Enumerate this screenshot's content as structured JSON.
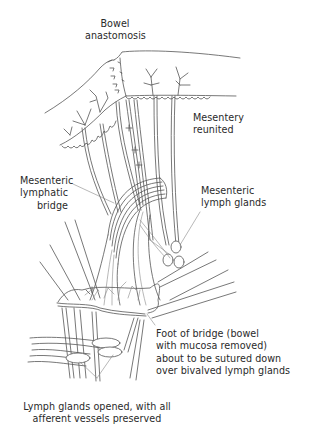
{
  "figure": {
    "type": "surgical-illustration",
    "stroke_color": "#555555",
    "label_color": "#2a2a2a",
    "background": "#ffffff"
  },
  "labels": {
    "bowel_anastomosis": {
      "lines": [
        "Bowel",
        "anastomosis"
      ]
    },
    "mesentery_reunited": {
      "lines": [
        "Mesentery",
        "reunited"
      ]
    },
    "mesenteric_lymphatic_bridge": {
      "lines": [
        "Mesenteric",
        "lymphatic",
        "bridge"
      ]
    },
    "mesenteric_lymph_glands": {
      "lines": [
        "Mesenteric",
        "lymph glands"
      ]
    },
    "foot_of_bridge": {
      "lines": [
        "Foot of bridge (bowel",
        "with mucosa removed)",
        "about to be sutured down",
        "over bivalved lymph glands"
      ]
    },
    "lymph_glands_opened": {
      "lines": [
        "Lymph glands opened, with all",
        "afferent vessels preserved"
      ]
    }
  }
}
